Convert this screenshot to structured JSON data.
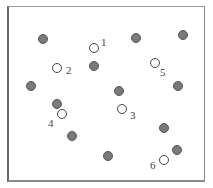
{
  "diagram": {
    "type": "point-set",
    "frame": {
      "x": 7,
      "y": 6,
      "width": 198,
      "height": 176,
      "color": "#8a8a8a"
    },
    "colors": {
      "filled": "#7a7a7a",
      "filled_border": "#555555",
      "open_border": "#444444",
      "label": "#444444"
    },
    "filled_points": [
      {
        "x": 43,
        "y": 39
      },
      {
        "x": 94,
        "y": 66
      },
      {
        "x": 136,
        "y": 38
      },
      {
        "x": 183,
        "y": 35
      },
      {
        "x": 31,
        "y": 86
      },
      {
        "x": 57,
        "y": 104
      },
      {
        "x": 119,
        "y": 91
      },
      {
        "x": 178,
        "y": 86
      },
      {
        "x": 72,
        "y": 136
      },
      {
        "x": 164,
        "y": 128
      },
      {
        "x": 108,
        "y": 156
      },
      {
        "x": 177,
        "y": 150
      }
    ],
    "open_points": [
      {
        "label": "1",
        "x": 94,
        "y": 48,
        "lx": 101,
        "ly": 37
      },
      {
        "label": "2",
        "x": 57,
        "y": 68,
        "lx": 66,
        "ly": 65
      },
      {
        "label": "3",
        "x": 122,
        "y": 109,
        "lx": 130,
        "ly": 110
      },
      {
        "label": "4",
        "x": 62,
        "y": 114,
        "lx": 48,
        "ly": 118
      },
      {
        "label": "5",
        "x": 155,
        "y": 63,
        "lx": 160,
        "ly": 67
      },
      {
        "label": "6",
        "x": 164,
        "y": 160,
        "lx": 150,
        "ly": 160
      }
    ]
  }
}
